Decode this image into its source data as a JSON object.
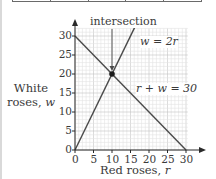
{
  "table_stub": {
    "columns": 5
  },
  "chart_data": {
    "type": "line",
    "title": "",
    "xlabel": "Red roses, r",
    "ylabel": "White roses, w",
    "xlabel_parts": {
      "text": "Red roses, ",
      "var": "r"
    },
    "ylabel_parts": {
      "line1": "White",
      "line2_text": "roses, ",
      "line2_var": "w"
    },
    "xlim": [
      0,
      30
    ],
    "ylim": [
      0,
      30
    ],
    "x_ticks": [
      0,
      5,
      10,
      15,
      20,
      25,
      30
    ],
    "y_ticks": [
      0,
      5,
      10,
      15,
      20,
      25,
      30
    ],
    "x_tick_labels": [
      "0",
      "5",
      "10",
      "15",
      "20",
      "25",
      "30"
    ],
    "y_tick_labels": [
      "0",
      "5",
      "10",
      "15",
      "20",
      "25",
      "30"
    ],
    "grid": true,
    "grid_minor_step": 1,
    "grid_major_step": 5,
    "series": [
      {
        "name": "w = 2r",
        "label": "w = 2r",
        "points": [
          [
            0,
            0
          ],
          [
            16.5,
            33
          ]
        ]
      },
      {
        "name": "r + w = 30",
        "label": "r + w = 30",
        "points": [
          [
            0,
            30
          ],
          [
            30,
            0
          ]
        ]
      }
    ],
    "annotations": [
      {
        "text": "intersection",
        "point": [
          10,
          20
        ],
        "type": "arrow-label"
      }
    ],
    "intersection": {
      "r": 10,
      "w": 20
    }
  },
  "labels": {
    "intersection": "intersection",
    "line1": "w = 2r",
    "line2": "r + w = 30"
  },
  "colors": {
    "axis": "#2a2a2a",
    "line": "#4a4a4a",
    "grid_minor": "#e2e2e2",
    "grid_major": "#c4c4c4",
    "dot": "#1a1a1a"
  }
}
